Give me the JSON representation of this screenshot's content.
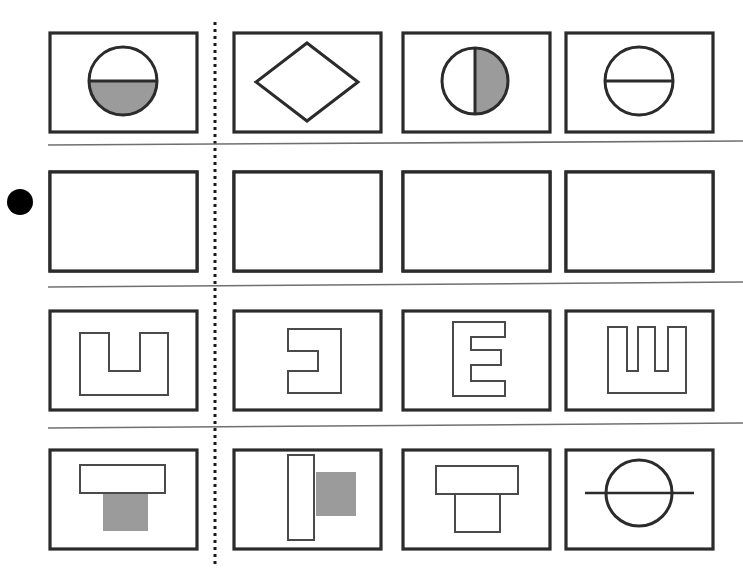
{
  "page": {
    "background_color": "#ffffff",
    "width": 743,
    "height": 575,
    "marker": {
      "name": "row-marker-dot",
      "shape": "filled-circle",
      "color": "#000000",
      "cx": 20,
      "cy": 202,
      "r": 13,
      "marks_row": 2
    },
    "vertical_divider": {
      "name": "dotted-vertical-divider",
      "style": "dotted",
      "color": "#1a1a1a",
      "x": 215,
      "y_top": 22,
      "y_bottom": 568
    },
    "horizontal_rules": [
      {
        "name": "rule-after-row-1",
        "x1": 48,
        "y1": 145,
        "x2": 743,
        "y2": 141
      },
      {
        "name": "rule-after-row-2",
        "x1": 48,
        "y1": 287,
        "x2": 743,
        "y2": 282
      },
      {
        "name": "rule-after-row-3",
        "x1": 48,
        "y1": 428,
        "x2": 743,
        "y2": 423
      }
    ]
  },
  "colors": {
    "frame_stroke": "#2b2b2b",
    "shape_stroke": "#4a4a4a",
    "fill_gray": "#9b9b9b",
    "rule_gray": "#6f6f6f",
    "dot_black": "#000000",
    "paper_white": "#ffffff"
  },
  "grid": {
    "rows": 4,
    "columns": 4,
    "cell_width": 147,
    "cell_height": 99,
    "column_x": [
      50,
      234,
      403,
      566
    ],
    "row_y": [
      33,
      172,
      311,
      450
    ]
  },
  "cells": [
    {
      "id": "r1c1",
      "row": 1,
      "col": 1,
      "name": "cell-circle-half-filled-bottom",
      "description": "Circle with horizontal diameter line; lower half shaded gray"
    },
    {
      "id": "r1c2",
      "row": 1,
      "col": 2,
      "name": "cell-diamond-outline",
      "description": "Unfilled diamond (square rotated 45 degrees) outline"
    },
    {
      "id": "r1c3",
      "row": 1,
      "col": 3,
      "name": "cell-circle-half-filled-right",
      "description": "Circle with vertical diameter line; right half shaded gray"
    },
    {
      "id": "r1c4",
      "row": 1,
      "col": 4,
      "name": "cell-circle-horizontal-line",
      "description": "Unfilled circle bisected by a horizontal diameter line"
    },
    {
      "id": "r2c1",
      "row": 2,
      "col": 1,
      "name": "cell-vertical-s-curve",
      "description": "Thick gray S-shaped band running top to bottom"
    },
    {
      "id": "r2c2",
      "row": 2,
      "col": 2,
      "name": "cell-diagonal-band",
      "description": "Thick gray diagonal band from top-left to bottom-right"
    },
    {
      "id": "r2c3",
      "row": 2,
      "col": 3,
      "name": "cell-x-cross-bands",
      "description": "Two thick gray diagonal bands crossing in an X"
    },
    {
      "id": "r2c4",
      "row": 2,
      "col": 4,
      "name": "cell-horizontal-s-wave",
      "description": "Thick gray S-shaped band lying on its side, left to right"
    },
    {
      "id": "r3c1",
      "row": 3,
      "col": 1,
      "name": "cell-u-outline",
      "description": "Outlined U shape, opening upward"
    },
    {
      "id": "r3c2",
      "row": 3,
      "col": 2,
      "name": "cell-c-outline-reversed",
      "description": "Outlined C shape opening to the left (reversed C)"
    },
    {
      "id": "r3c3",
      "row": 3,
      "col": 3,
      "name": "cell-e-outline",
      "description": "Outlined block letter E opening to the right"
    },
    {
      "id": "r3c4",
      "row": 3,
      "col": 4,
      "name": "cell-comb-outline",
      "description": "Outlined comb shape, block E rotated to open upward"
    },
    {
      "id": "r4c1",
      "row": 4,
      "col": 1,
      "name": "cell-t-white-bar-gray-stem",
      "description": "Wide white outlined bar on top with gray filled square stem below"
    },
    {
      "id": "r4c2",
      "row": 4,
      "col": 2,
      "name": "cell-t-rotated-white-bar-gray-block",
      "description": "Tall white outlined bar with gray filled square to its right"
    },
    {
      "id": "r4c3",
      "row": 4,
      "col": 3,
      "name": "cell-t-all-white",
      "description": "Wide white outlined bar on top with white outlined square stem below"
    },
    {
      "id": "r4c4",
      "row": 4,
      "col": 4,
      "name": "cell-circle-with-through-line",
      "description": "Unfilled circle pierced by a horizontal line extending past both sides"
    }
  ]
}
